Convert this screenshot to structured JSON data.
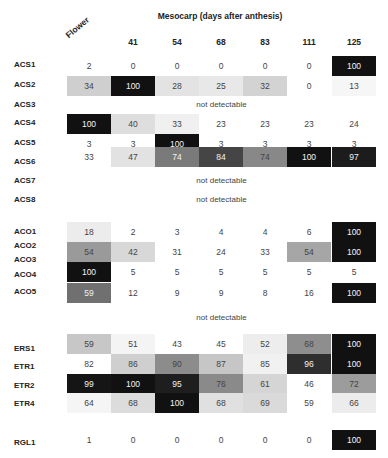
{
  "chart_data": {
    "type": "heatmap",
    "title": "Mesocarp (days after anthesis)",
    "columns": [
      "Flower",
      "41",
      "54",
      "68",
      "83",
      "111",
      "125"
    ],
    "not_detectable_label": "not detectable",
    "groups": [
      {
        "rows": [
          {
            "gene": "ACS1",
            "values": [
              2,
              0,
              0,
              0,
              0,
              0,
              100
            ]
          },
          {
            "gene": "ACS2",
            "values": [
              34,
              100,
              28,
              25,
              32,
              0,
              13
            ]
          },
          {
            "gene": "ACS3",
            "values": null
          },
          {
            "gene": "ACS4",
            "values": [
              100,
              40,
              33,
              23,
              23,
              23,
              24
            ]
          },
          {
            "gene": "ACS5",
            "values": [
              3,
              3,
              100,
              3,
              3,
              3,
              3
            ]
          },
          {
            "gene": "ACS6",
            "values": [
              33,
              47,
              74,
              84,
              74,
              100,
              97
            ]
          },
          {
            "gene": "ACS7",
            "values": null
          },
          {
            "gene": "ACS8",
            "values": null
          }
        ]
      },
      {
        "rows": [
          {
            "gene": "ACO1",
            "values": [
              18,
              2,
              3,
              4,
              4,
              6,
              100
            ]
          },
          {
            "gene": "ACO2/ACO3",
            "values": [
              54,
              42,
              31,
              24,
              33,
              54,
              100
            ]
          },
          {
            "gene": "ACO4",
            "values": [
              100,
              5,
              5,
              5,
              5,
              5,
              5
            ]
          },
          {
            "gene": "ACO5",
            "values": [
              59,
              12,
              9,
              9,
              8,
              16,
              100
            ]
          }
        ]
      },
      {
        "rows": [
          {
            "gene": "(unlabeled)",
            "values": null
          },
          {
            "gene": "ERS1",
            "values": [
              59,
              51,
              43,
              45,
              52,
              68,
              100
            ]
          },
          {
            "gene": "ETR1",
            "values": [
              82,
              86,
              90,
              87,
              85,
              96,
              100
            ]
          },
          {
            "gene": "ETR2",
            "values": [
              99,
              100,
              95,
              76,
              61,
              46,
              72
            ]
          },
          {
            "gene": "ETR4",
            "values": [
              64,
              68,
              100,
              68,
              69,
              59,
              66
            ]
          }
        ]
      },
      {
        "rows": [
          {
            "gene": "RGL1",
            "values": [
              1,
              0,
              0,
              0,
              0,
              0,
              100
            ]
          }
        ]
      }
    ]
  },
  "labels": {
    "title": "Mesocarp (days after anthesis)",
    "flower": "Flower",
    "cols": [
      "41",
      "54",
      "68",
      "83",
      "111",
      "125"
    ],
    "nd": "not detectable"
  },
  "rows": [
    {
      "label": "ACS1",
      "top": 56,
      "labelTop": 60,
      "h": 20,
      "cells": [
        "2",
        "0",
        "0",
        "0",
        "0",
        "0",
        "100"
      ],
      "fills": [
        "#fff",
        "#fff",
        "#fff",
        "#fff",
        "#fff",
        "#fff",
        "#111"
      ]
    },
    {
      "label": "ACS2",
      "top": 76,
      "labelTop": 80,
      "h": 20,
      "cells": [
        "34",
        "100",
        "28",
        "25",
        "32",
        "0",
        "13"
      ],
      "fills": [
        "#cfcfcf",
        "#111",
        "#e3e3e3",
        "#e8e8e8",
        "#d3d3d3",
        "#fff",
        "#f6f6f6"
      ]
    },
    {
      "label": "ACS3",
      "labelTop": 100,
      "nd": true,
      "ndTop": 100
    },
    {
      "label": "ACS4",
      "top": 114,
      "labelTop": 118,
      "h": 20,
      "cells": [
        "100",
        "40",
        "33",
        "23",
        "23",
        "23",
        "24"
      ],
      "fills": [
        "#111",
        "#dedede",
        "#f0f0f0",
        "#fff",
        "#fff",
        "#fff",
        "#fff"
      ]
    },
    {
      "label": "ACS5",
      "top": 134,
      "labelTop": 138,
      "h": 20,
      "cells": [
        "3",
        "3",
        "100",
        "3",
        "3",
        "3",
        "3"
      ],
      "fills": [
        "#fff",
        "#fff",
        "#111",
        "#fff",
        "#fff",
        "#fff",
        "#fff"
      ]
    },
    {
      "label": "ACS6",
      "top": 147,
      "labelTop": 157,
      "h": 20,
      "cells": [
        "33",
        "47",
        "74",
        "84",
        "74",
        "100",
        "97"
      ],
      "fills": [
        "#fff",
        "#e2e2e2",
        "#7a7a7a",
        "#454545",
        "#888888",
        "#111",
        "#1c1c1c"
      ]
    },
    {
      "label": "ACS7",
      "labelTop": 176,
      "nd": true,
      "ndTop": 176
    },
    {
      "label": "ACS8",
      "labelTop": 195,
      "nd": true,
      "ndTop": 195
    },
    {
      "label": "ACO1",
      "top": 222,
      "labelTop": 227,
      "h": 20,
      "cells": [
        "18",
        "2",
        "3",
        "4",
        "4",
        "6",
        "100"
      ],
      "fills": [
        "#ececec",
        "#fff",
        "#fff",
        "#fff",
        "#fff",
        "#fff",
        "#111"
      ]
    },
    {
      "label": "ACO2",
      "labelTop": 241
    },
    {
      "label": "ACO3",
      "top": 242,
      "labelTop": 255,
      "h": 20,
      "cells": [
        "54",
        "42",
        "31",
        "24",
        "33",
        "54",
        "100"
      ],
      "fills": [
        "#9a9a9a",
        "#d8d8d8",
        "#fff",
        "#fff",
        "#fff",
        "#a6a6a6",
        "#111"
      ]
    },
    {
      "label": "ACO4",
      "top": 262,
      "labelTop": 270,
      "h": 20,
      "cells": [
        "100",
        "5",
        "5",
        "5",
        "5",
        "5",
        "5"
      ],
      "fills": [
        "#111",
        "#fff",
        "#fff",
        "#fff",
        "#fff",
        "#fff",
        "#fff"
      ]
    },
    {
      "label": "ACO5",
      "top": 283,
      "labelTop": 287,
      "h": 20,
      "cells": [
        "59",
        "12",
        "9",
        "9",
        "8",
        "16",
        "100"
      ],
      "fills": [
        "#707070",
        "#fff",
        "#fff",
        "#fff",
        "#fff",
        "#fff",
        "#111"
      ]
    },
    {
      "ndOnly": true,
      "ndTop": 313
    },
    {
      "label": "ERS1",
      "top": 334,
      "labelTop": 344,
      "h": 20,
      "cells": [
        "59",
        "51",
        "43",
        "45",
        "52",
        "68",
        "100"
      ],
      "fills": [
        "#c7c7c7",
        "#f4f4f4",
        "#fff",
        "#fff",
        "#ededed",
        "#8e8e8e",
        "#111"
      ]
    },
    {
      "label": "ETR1",
      "top": 354,
      "labelTop": 362,
      "h": 20,
      "cells": [
        "82",
        "86",
        "90",
        "87",
        "85",
        "96",
        "100"
      ],
      "fills": [
        "#fff",
        "#cfcfcf",
        "#8c8c8c",
        "#c6c6c6",
        "#f1f1f1",
        "#2e2e2e",
        "#111"
      ]
    },
    {
      "label": "ETR2",
      "top": 374,
      "labelTop": 381,
      "h": 20,
      "cells": [
        "99",
        "100",
        "95",
        "76",
        "61",
        "46",
        "72"
      ],
      "fills": [
        "#151515",
        "#111",
        "#1e1e1e",
        "#8a8a8a",
        "#d5d5d5",
        "#fff",
        "#9c9c9c"
      ]
    },
    {
      "label": "ETR4",
      "top": 393,
      "labelTop": 399,
      "h": 20,
      "cells": [
        "64",
        "68",
        "100",
        "68",
        "69",
        "59",
        "66"
      ],
      "fills": [
        "#f5f5f5",
        "#dcdcdc",
        "#111",
        "#e0e0e0",
        "#dadada",
        "#fff",
        "#ececec"
      ]
    },
    {
      "label": "RGL1",
      "top": 430,
      "labelTop": 438,
      "h": 20,
      "cells": [
        "1",
        "0",
        "0",
        "0",
        "0",
        "0",
        "100"
      ],
      "fills": [
        "#fff",
        "#fff",
        "#fff",
        "#fff",
        "#fff",
        "#fff",
        "#111"
      ]
    }
  ]
}
